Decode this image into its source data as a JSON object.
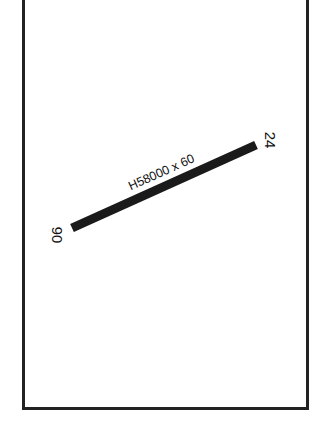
{
  "diagram": {
    "type": "airport-runway-diagram",
    "runway": {
      "label": "H58000 x 60",
      "end_a": "06",
      "end_b": "24",
      "color": "#1a1a1a"
    },
    "frame_color": "#222222",
    "background": "#ffffff"
  }
}
